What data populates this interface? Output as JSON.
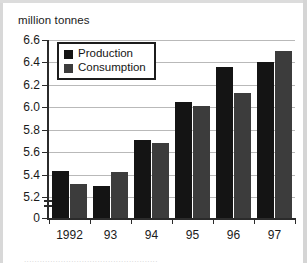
{
  "chart_data": {
    "type": "bar",
    "title": "",
    "subtitle": "",
    "xlabel": "",
    "ylabel": "million tonnes",
    "categories": [
      "1992",
      "93",
      "94",
      "95",
      "96",
      "97"
    ],
    "series": [
      {
        "name": "Production",
        "color": "#141414",
        "values": [
          5.43,
          5.3,
          5.71,
          6.05,
          6.36,
          6.4
        ]
      },
      {
        "name": "Consumption",
        "color": "#3c3c3c",
        "values": [
          5.32,
          5.42,
          5.68,
          6.01,
          6.13,
          6.5
        ]
      }
    ],
    "yticks": [
      "6.6",
      "6.4",
      "6.2",
      "6.0",
      "5.8",
      "5.6",
      "5.4",
      "5.2",
      "0"
    ],
    "ytick_values": [
      6.6,
      6.4,
      6.2,
      6.0,
      5.8,
      5.6,
      5.4,
      5.2,
      0
    ],
    "ylim": [
      5.1,
      6.6
    ],
    "y_axis_broken": true,
    "grid": true,
    "legend_position": "top-left-inside",
    "legend_boxed": true
  },
  "axis_title": "million tonnes",
  "legend": {
    "items": [
      {
        "label": "Production"
      },
      {
        "label": "Consumption"
      }
    ]
  },
  "caption": {
    "text": "..................................................."
  }
}
